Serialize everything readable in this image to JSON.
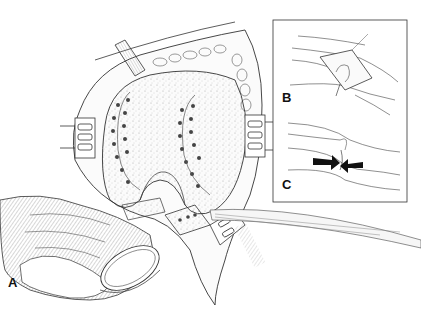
{
  "figure": {
    "panels": [
      {
        "id": "A",
        "label": "A",
        "content": "open knee exposure with femoral condyles, retractors, hand holding trial component"
      },
      {
        "id": "B",
        "label": "B",
        "content": "skin incision on limb with exposed joint"
      },
      {
        "id": "C",
        "label": "C",
        "content": "limb with two arrows pointing toward joint"
      }
    ]
  },
  "colors": {
    "line": "#222222",
    "background": "#ffffff",
    "shade": "#9a9a9a",
    "arrow": "#111111"
  }
}
